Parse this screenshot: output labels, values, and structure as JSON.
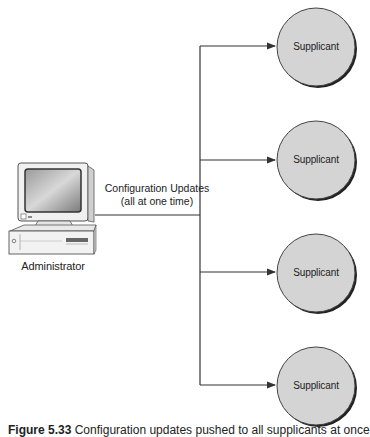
{
  "diagram": {
    "administrator": {
      "label": "Administrator",
      "icon": "desktop-computer-icon"
    },
    "edge_label": {
      "line1": "Configuration Updates",
      "line2": "(all at one time)"
    },
    "supplicants": [
      {
        "label": "Supplicant"
      },
      {
        "label": "Supplicant"
      },
      {
        "label": "Supplicant"
      },
      {
        "label": "Supplicant"
      }
    ],
    "colors": {
      "circle_fill": "#d4d4d4",
      "circle_stroke": "#333333",
      "line": "#333333"
    }
  },
  "caption": {
    "prefix": "Figure 5.33",
    "text": "Configuration updates pushed to all supplicants at once"
  }
}
